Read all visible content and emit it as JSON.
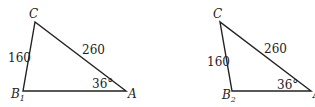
{
  "figures": [
    {
      "id": "triangle-1",
      "vertices": {
        "C": "C",
        "B": "B",
        "B_sub": "1",
        "A": "A"
      },
      "side_CB": "160",
      "side_CA": "260",
      "angle_A": "36°"
    },
    {
      "id": "triangle-2",
      "vertices": {
        "C": "C",
        "B": "B",
        "B_sub": "2",
        "A": "A"
      },
      "side_CB": "160",
      "side_CA": "260",
      "angle_A": "36°"
    }
  ],
  "colors": {
    "stroke": "#222222",
    "background": "#ffffff"
  }
}
